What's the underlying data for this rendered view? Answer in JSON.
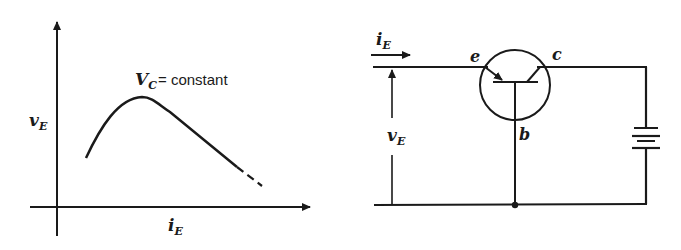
{
  "graph": {
    "y_axis_label": "v",
    "y_axis_label_sub": "E",
    "x_axis_label": "i",
    "x_axis_label_sub": "E",
    "curve_label_var": "V",
    "curve_label_sub": "C",
    "curve_label_rest": "= constant"
  },
  "circuit": {
    "current_label": "i",
    "current_label_sub": "E",
    "voltage_label": "v",
    "voltage_label_sub": "E",
    "terminal_emitter": "e",
    "terminal_collector": "c",
    "terminal_base": "b"
  },
  "colors": {
    "ink": "#1a1a1a",
    "background": "#ffffff"
  }
}
